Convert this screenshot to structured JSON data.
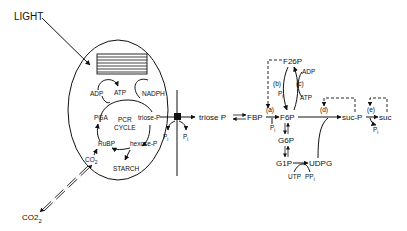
{
  "diagram": {
    "external": {
      "light": "LIGHT",
      "co2_outside": "CO2",
      "co2_outside_sub": "2"
    },
    "chloroplast": {
      "adp": "ADP",
      "atp": "ATP",
      "nadph": "NADPH",
      "pga": "PGA",
      "cycle_line1": "PCR",
      "cycle_line2": "CYCLE",
      "triose_p": "triose-P",
      "rubp": "RuBP",
      "hexose_p": "hexose-P",
      "starch": "STARCH",
      "co2_inside": "CO",
      "co2_inside_sub": "2",
      "pi_left": "P",
      "pi_right": "P",
      "pi_sub": "i"
    },
    "cytosol": {
      "triose_p": "triose P",
      "fbp": "FBP",
      "f6p": "F6P",
      "f26p": "F26P",
      "g6p": "G6P",
      "g1p": "G1P",
      "udpg": "UDPG",
      "utp": "UTP",
      "ppi": "PP",
      "ppi_sub": "i",
      "suc_p": "suc-P",
      "suc": "suc",
      "adp": "ADP",
      "atp": "ATP",
      "pi": "P",
      "pi_sub": "i",
      "step_a": "(a)",
      "step_b": "(b)",
      "step_c": "(c)",
      "step_d": "(d)",
      "step_e": "(e)"
    }
  }
}
